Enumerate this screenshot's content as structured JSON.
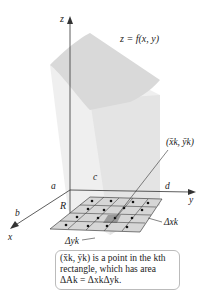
{
  "diagram": {
    "surface_label": "z = f(x, y)",
    "axes": {
      "x": "x",
      "y": "y",
      "z": "z"
    },
    "bounds": {
      "a": "a",
      "b": "b",
      "c": "c",
      "d": "d"
    },
    "region_label": "R",
    "point_label": "(x̄k, ȳk)",
    "delta_x_label": "Δxk",
    "delta_y_label": "Δyk",
    "grid": {
      "rows": 4,
      "cols": 5
    },
    "colors": {
      "surface": "#d9d9d9",
      "grid_fill": "#d6d6d6",
      "highlight": "#9a9a9a",
      "lines": "#333333"
    }
  },
  "caption": {
    "line1": "(x̄k, ȳk) is a point in the kth",
    "line2": "rectangle, which has area",
    "line3": "ΔAk = ΔxkΔyk."
  }
}
